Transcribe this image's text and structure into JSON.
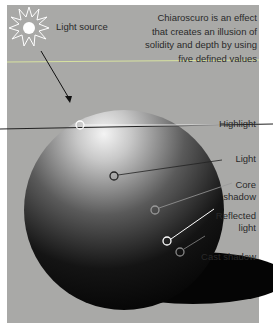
{
  "title_text": "Chiaroscuro is an effect that creates an illusion of solidity and depth by using five defined values",
  "description": [
    "Chiaroscuro is an effect",
    "that creates an illusion of",
    "solidity and depth by using",
    "five defined values"
  ],
  "labels": {
    "light_source": "Light source",
    "highlight": "Highlight",
    "light": "Light",
    "core_shadow": [
      "Core",
      "shadow"
    ],
    "reflected_light": [
      "Reflected",
      "light"
    ],
    "cast_shadow": "Cast shadow"
  },
  "colors": {
    "background": "#a9a9a7",
    "guide_line": "#d8e3a0"
  }
}
